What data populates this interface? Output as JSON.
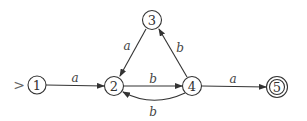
{
  "diagram": {
    "type": "finite-automaton",
    "start_marker": ">",
    "colors": {
      "stroke": "#333333",
      "background": "#ffffff"
    },
    "states": [
      {
        "id": "1",
        "label": "1",
        "x": 37,
        "y": 85,
        "start": true,
        "accepting": false
      },
      {
        "id": "2",
        "label": "2",
        "x": 114,
        "y": 86,
        "start": false,
        "accepting": false
      },
      {
        "id": "3",
        "label": "3",
        "x": 152,
        "y": 20,
        "start": false,
        "accepting": false
      },
      {
        "id": "4",
        "label": "4",
        "x": 192,
        "y": 86,
        "start": false,
        "accepting": false
      },
      {
        "id": "5",
        "label": "5",
        "x": 277,
        "y": 87,
        "start": false,
        "accepting": true
      }
    ],
    "transitions": [
      {
        "from": "1",
        "to": "2",
        "label": "a"
      },
      {
        "from": "3",
        "to": "2",
        "label": "a"
      },
      {
        "from": "2",
        "to": "4",
        "label": "b"
      },
      {
        "from": "4",
        "to": "3",
        "label": "b"
      },
      {
        "from": "4",
        "to": "2",
        "label": "b",
        "curved": true
      },
      {
        "from": "4",
        "to": "5",
        "label": "a"
      }
    ]
  }
}
